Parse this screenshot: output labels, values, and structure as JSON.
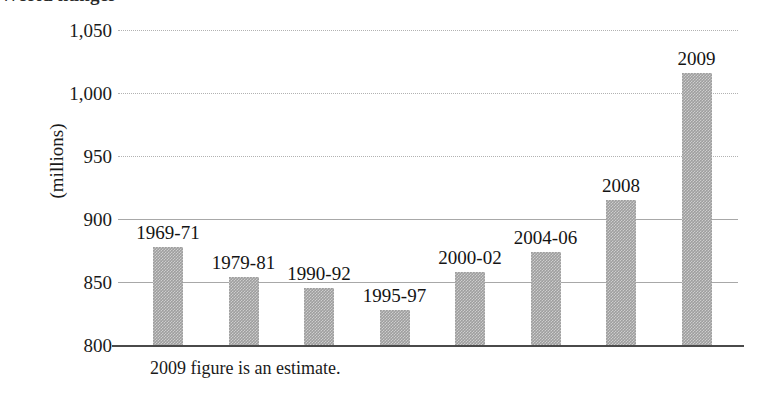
{
  "figure": {
    "title_remnant": "World hunger",
    "footnote": "2009 figure is an estimate.",
    "axis_title": "(millions)"
  },
  "chart_data": {
    "type": "bar",
    "title": "",
    "xlabel": "",
    "ylabel": "(millions)",
    "ylim": [
      800,
      1050
    ],
    "yticks": [
      "800",
      "850",
      "900",
      "950",
      "1,000",
      "1,050"
    ],
    "ytick_values": [
      800,
      850,
      900,
      950,
      1000,
      1050
    ],
    "grid": true,
    "legend": "none",
    "bar_color": "#9e9e9e",
    "categories": [
      "1969-71",
      "1979-81",
      "1990-92",
      "1995-97",
      "2000-02",
      "2004-06",
      "2008",
      "2009"
    ],
    "values": [
      878,
      854,
      845,
      828,
      858,
      874,
      915,
      1016
    ],
    "annotations": [
      "2009 figure is an estimate."
    ]
  },
  "bars": [
    {
      "label": "1969-71",
      "value": 878
    },
    {
      "label": "1979-81",
      "value": 854
    },
    {
      "label": "1990-92",
      "value": 845
    },
    {
      "label": "1995-97",
      "value": 828
    },
    {
      "label": "2000-02",
      "value": 858
    },
    {
      "label": "2004-06",
      "value": 874
    },
    {
      "label": "2008",
      "value": 915
    },
    {
      "label": "2009",
      "value": 1016
    }
  ],
  "yticks": [
    {
      "label": "1,050",
      "value": 1050
    },
    {
      "label": "1,000",
      "value": 1000
    },
    {
      "label": "950",
      "value": 950
    },
    {
      "label": "900",
      "value": 900
    },
    {
      "label": "850",
      "value": 850
    },
    {
      "label": "800",
      "value": 800
    }
  ]
}
